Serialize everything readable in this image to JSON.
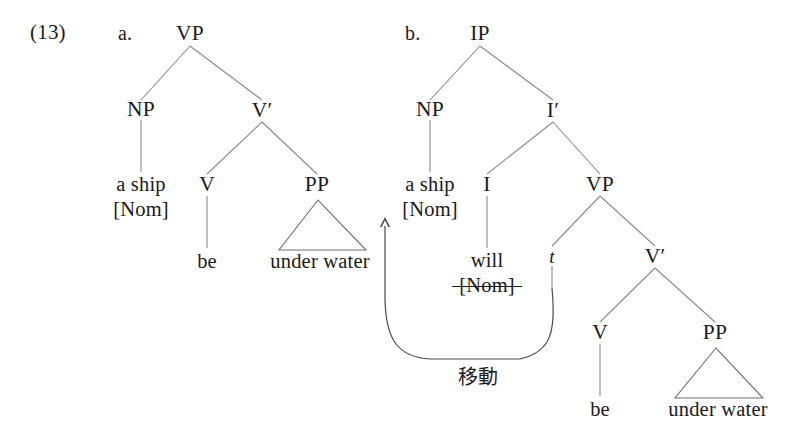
{
  "example": {
    "number": "(13)",
    "sub_a": "a.",
    "sub_b": "b."
  },
  "tree_a": {
    "root": "VP",
    "np": "NP",
    "vbar": "V′",
    "v": "V",
    "pp": "PP",
    "subject_line1": "a ship",
    "subject_line2": "[Nom]",
    "verb": "be",
    "pp_phrase": "under water"
  },
  "tree_b": {
    "root": "IP",
    "np": "NP",
    "ibar": "I′",
    "i": "I",
    "vp": "VP",
    "vbar": "V′",
    "v": "V",
    "pp": "PP",
    "subject_line1": "a ship",
    "subject_line2": "[Nom]",
    "infl": "will",
    "infl_struck": "[Nom]",
    "trace": "t",
    "verb": "be",
    "pp_phrase": "under water"
  },
  "annotation": {
    "movement_label": "移動"
  },
  "colors": {
    "text": "#1a1a1a",
    "branch": "#8a8a8a",
    "triangle": "#6f6f6f",
    "arrow": "#4a4a4a",
    "background": "#ffffff"
  }
}
